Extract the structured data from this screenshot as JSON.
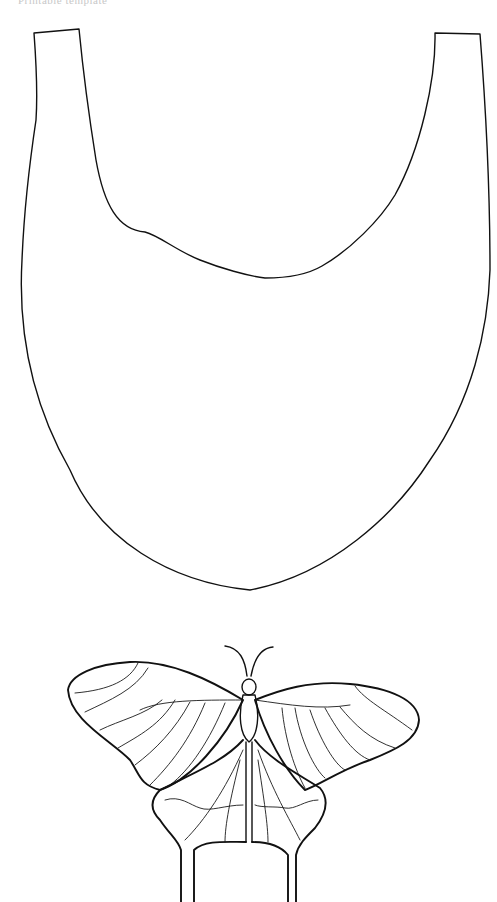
{
  "page": {
    "header_text": "Printable template",
    "background_color": "#ffffff",
    "line_color": "#111111"
  },
  "templates": [
    {
      "id": "tote-bag",
      "label": "Tote bag outline",
      "icon": "bag-outline-icon"
    },
    {
      "id": "butterfly",
      "label": "Swallowtail butterfly outline",
      "icon": "butterfly-outline-icon"
    }
  ]
}
